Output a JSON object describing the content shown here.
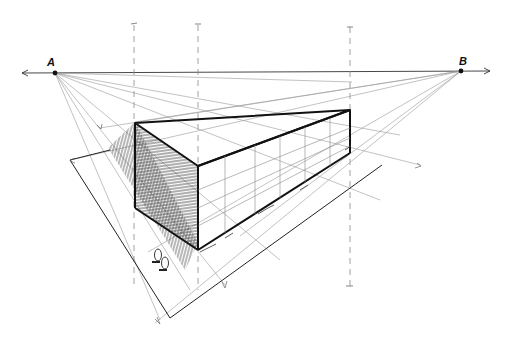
{
  "drawing": {
    "title": "Two-point perspective sketch of a box building",
    "vanishing_points": [
      {
        "label": "A",
        "x": 55,
        "y": 73
      },
      {
        "label": "B",
        "x": 461,
        "y": 71
      }
    ],
    "horizon_line": {
      "y": 73
    },
    "colors": {
      "ink": "#111111",
      "construction": "#888888",
      "paper": "#ffffff"
    }
  }
}
